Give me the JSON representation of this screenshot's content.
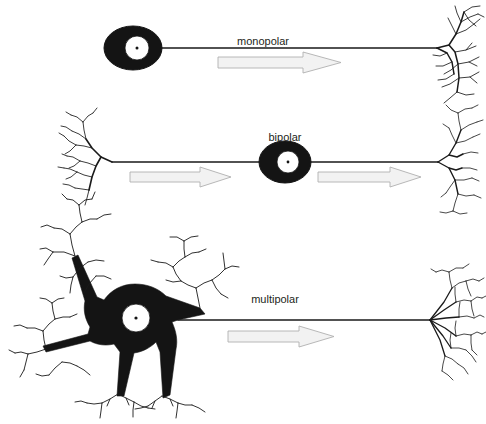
{
  "figure": {
    "background_color": "#ffffff",
    "ink_color": "#1a1a1a",
    "soma_color": "#141414",
    "nucleus_color": "#ffffff",
    "arrow_fill": "#f2f2f2",
    "arrow_stroke": "#b0b0b0",
    "label_color": "#231f20"
  },
  "neurons": [
    {
      "id": "monopolar",
      "label": "monopolar",
      "label_x": 263,
      "label_y": 45,
      "soma": {
        "cx": 133,
        "cy": 48,
        "rx": 29,
        "ry": 22
      },
      "nucleus": {
        "cx": 137,
        "cy": 48,
        "r": 12
      },
      "axon": {
        "x1": 162,
        "y1": 48,
        "x2": 437,
        "y2": 48
      },
      "arrows": [
        {
          "x": 218,
          "y": 62,
          "width": 123,
          "height": 13
        }
      ],
      "dendrite_side": "none",
      "terminal_side": "right"
    },
    {
      "id": "bipolar",
      "label": "bipolar",
      "label_x": 285,
      "label_y": 141,
      "soma": {
        "cx": 285,
        "cy": 162,
        "rx": 26,
        "ry": 21
      },
      "nucleus": {
        "cx": 288,
        "cy": 162,
        "r": 11
      },
      "axon": {
        "x1": 112,
        "y1": 162,
        "x2": 438,
        "y2": 162
      },
      "arrows": [
        {
          "x": 130,
          "y": 176,
          "width": 101,
          "height": 12
        },
        {
          "x": 318,
          "y": 176,
          "width": 103,
          "height": 12
        }
      ],
      "dendrite_side": "left",
      "terminal_side": "right"
    },
    {
      "id": "multipolar",
      "label": "multipolar",
      "label_x": 275,
      "label_y": 303,
      "soma": {
        "cx": 135,
        "cy": 318,
        "rx": 46,
        "ry": 38
      },
      "nucleus": {
        "cx": 136,
        "cy": 318,
        "r": 14
      },
      "axon": {
        "x1": 178,
        "y1": 320,
        "x2": 430,
        "y2": 320
      },
      "arrows": [
        {
          "x": 228,
          "y": 335,
          "width": 106,
          "height": 12
        }
      ],
      "dendrite_side": "radial",
      "terminal_side": "right"
    }
  ],
  "annotations": {
    "signal_direction": "left to right",
    "arrow_count_total": 4,
    "neuron_count": 3
  }
}
